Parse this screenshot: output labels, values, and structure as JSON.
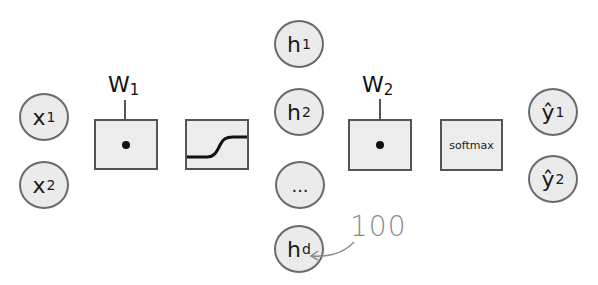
{
  "inputs": [
    {
      "base": "x",
      "sub": "1"
    },
    {
      "base": "x",
      "sub": "2"
    }
  ],
  "weights": [
    {
      "base": "W",
      "sub": "1"
    },
    {
      "base": "W",
      "sub": "2"
    }
  ],
  "hidden": [
    {
      "base": "h",
      "sub": "1"
    },
    {
      "base": "h",
      "sub": "2"
    },
    {
      "base": "...",
      "sub": ""
    },
    {
      "base": "h",
      "sub": "d"
    }
  ],
  "ops": {
    "dot_product_1": "dot-product",
    "activation": "sigmoid",
    "dot_product_2": "dot-product",
    "softmax_label": "softmax"
  },
  "outputs": [
    {
      "base": "ŷ",
      "sub": "1"
    },
    {
      "base": "ŷ",
      "sub": "2"
    }
  ],
  "annotation": {
    "text": "100",
    "points_to": "h_d"
  },
  "colors": {
    "node_fill": "#ebebeb",
    "node_stroke": "#6a6a6a",
    "box_fill": "#ececec",
    "box_stroke": "#555555",
    "annotation": "#8a8a8a"
  }
}
